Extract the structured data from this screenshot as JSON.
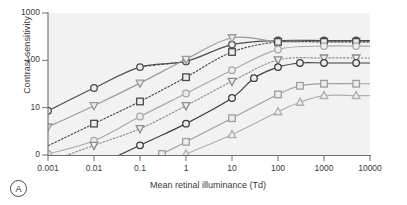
{
  "figure": {
    "panel_label": "A",
    "background": "#ffffff",
    "plot_background": "#f2f2f2"
  },
  "chart_data": {
    "type": "line",
    "title": "",
    "xlabel": "Mean retinal illuminance (Td)",
    "ylabel": "Contrast sensitivity",
    "xscale": "log",
    "yscale": "log",
    "xlim": [
      0.001,
      10000
    ],
    "ylim": [
      1,
      1000
    ],
    "grid": false,
    "legend": "none",
    "xticklabels": [
      "0.001",
      "0.01",
      "0.1",
      "1",
      "10",
      "100",
      "1000",
      "10000"
    ],
    "xtickvalues": [
      0.001,
      0.01,
      0.1,
      1,
      10,
      100,
      1000,
      10000
    ],
    "yticklabels": [
      "1000",
      "100",
      "10",
      "0"
    ],
    "ytickvalues": [
      1000,
      100,
      10,
      1
    ],
    "series": [
      {
        "name": "series-1-circle-dark",
        "marker": "circle",
        "color": "#4d4d4d",
        "linestyle": "solid",
        "plateau": 260,
        "points": [
          {
            "x": 0.001,
            "y": 8.6
          },
          {
            "x": 0.01,
            "y": 26
          },
          {
            "x": 0.1,
            "y": 72
          },
          {
            "x": 1,
            "y": 95
          },
          {
            "x": 10,
            "y": 215
          },
          {
            "x": 100,
            "y": 262
          },
          {
            "x": 1000,
            "y": 262
          },
          {
            "x": 5000,
            "y": 262
          }
        ],
        "dashed_segment": {
          "from_x": 0.1,
          "to_x": 1,
          "from_y": 72,
          "to_y": 95
        }
      },
      {
        "name": "series-2-triangle-down-light",
        "marker": "triangle-down",
        "color": "#9a9a9a",
        "linestyle": "solid",
        "plateau": 250,
        "points": [
          {
            "x": 0.001,
            "y": 3.9
          },
          {
            "x": 0.01,
            "y": 11
          },
          {
            "x": 0.1,
            "y": 33
          },
          {
            "x": 1,
            "y": 105
          },
          {
            "x": 10,
            "y": 300
          },
          {
            "x": 100,
            "y": 248
          },
          {
            "x": 1000,
            "y": 248
          },
          {
            "x": 5000,
            "y": 248
          }
        ]
      },
      {
        "name": "series-3-square-dark",
        "marker": "square",
        "color": "#4a4a4a",
        "linestyle": "dotted",
        "plateau": 240,
        "points": [
          {
            "x": 0.01,
            "y": 4.6
          },
          {
            "x": 0.1,
            "y": 13.5
          },
          {
            "x": 1,
            "y": 44
          },
          {
            "x": 10,
            "y": 150
          },
          {
            "x": 100,
            "y": 245
          },
          {
            "x": 1000,
            "y": 245
          },
          {
            "x": 5000,
            "y": 245
          }
        ]
      },
      {
        "name": "series-4-circle-gray",
        "marker": "circle",
        "color": "#a8a8a8",
        "linestyle": "solid",
        "plateau": 200,
        "points": [
          {
            "x": 0.001,
            "y": 1.05
          },
          {
            "x": 0.01,
            "y": 2.0
          },
          {
            "x": 0.1,
            "y": 6.5
          },
          {
            "x": 1,
            "y": 20
          },
          {
            "x": 10,
            "y": 62
          },
          {
            "x": 100,
            "y": 170
          },
          {
            "x": 1000,
            "y": 200
          },
          {
            "x": 5000,
            "y": 200
          }
        ]
      },
      {
        "name": "series-5-triangle-down-mid",
        "marker": "triangle-down",
        "color": "#8c8c8c",
        "linestyle": "dotted",
        "plateau": 112,
        "points": [
          {
            "x": 0.01,
            "y": 1.6
          },
          {
            "x": 0.1,
            "y": 3.6
          },
          {
            "x": 1,
            "y": 11
          },
          {
            "x": 10,
            "y": 36
          },
          {
            "x": 100,
            "y": 102
          },
          {
            "x": 1000,
            "y": 112
          },
          {
            "x": 5000,
            "y": 112
          }
        ]
      },
      {
        "name": "series-6-circle-dark-low",
        "marker": "circle",
        "color": "#3d3d3d",
        "linestyle": "solid",
        "plateau": 88,
        "points": [
          {
            "x": 0.1,
            "y": 1.6
          },
          {
            "x": 1,
            "y": 4.6
          },
          {
            "x": 10,
            "y": 16
          },
          {
            "x": 30,
            "y": 42
          },
          {
            "x": 100,
            "y": 72
          },
          {
            "x": 300,
            "y": 88
          },
          {
            "x": 1000,
            "y": 88
          },
          {
            "x": 5000,
            "y": 88
          }
        ]
      },
      {
        "name": "series-7-square-mid",
        "marker": "square",
        "color": "#9e9e9e",
        "linestyle": "solid",
        "plateau": 32,
        "points": [
          {
            "x": 0.3,
            "y": 1.05
          },
          {
            "x": 1,
            "y": 1.9
          },
          {
            "x": 10,
            "y": 6.0
          },
          {
            "x": 100,
            "y": 19
          },
          {
            "x": 300,
            "y": 29
          },
          {
            "x": 1000,
            "y": 32
          },
          {
            "x": 5000,
            "y": 32
          }
        ]
      },
      {
        "name": "series-8-triangle-up-light",
        "marker": "triangle-up",
        "color": "#b0b0b0",
        "linestyle": "solid",
        "plateau": 18,
        "points": [
          {
            "x": 1,
            "y": 1.05
          },
          {
            "x": 10,
            "y": 2.7
          },
          {
            "x": 100,
            "y": 8.2
          },
          {
            "x": 300,
            "y": 13
          },
          {
            "x": 1000,
            "y": 18
          },
          {
            "x": 5000,
            "y": 18
          }
        ]
      }
    ]
  }
}
